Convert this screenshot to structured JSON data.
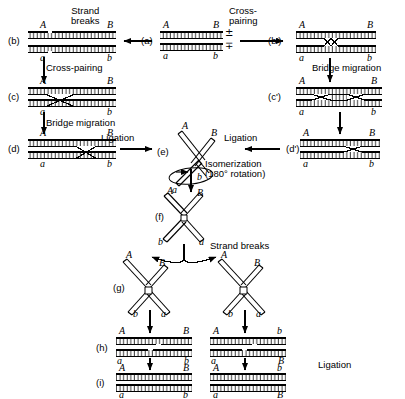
{
  "figure": {
    "type": "molecular-biology-pathway-diagram",
    "background": "#ffffff",
    "ink": "#000000"
  },
  "stages": [
    {
      "id": "a",
      "label": "(a)",
      "x": 141,
      "y": 41,
      "desc": "two aligned parental duplexes"
    },
    {
      "id": "b",
      "label": "(b)",
      "x": 8,
      "y": 41,
      "desc": "duplexes with single-strand breaks (nicks)"
    },
    {
      "id": "c",
      "label": "(c)",
      "x": 8,
      "y": 96,
      "desc": "cross-paired single crossover"
    },
    {
      "id": "d",
      "label": "(d)",
      "x": 8,
      "y": 150,
      "desc": "bridge migrated heteroduplex"
    },
    {
      "id": "bp",
      "label": "(b')",
      "x": 268,
      "y": 41,
      "desc": "cross-paired right branch"
    },
    {
      "id": "cp",
      "label": "(c')",
      "x": 268,
      "y": 96,
      "desc": "bridge migration right branch"
    },
    {
      "id": "dp",
      "label": "(d')",
      "x": 286,
      "y": 148,
      "desc": "ligated right branch"
    },
    {
      "id": "e",
      "label": "(e)",
      "x": 157,
      "y": 148,
      "desc": "chi-form Holliday junction"
    },
    {
      "id": "f",
      "label": "(f)",
      "x": 155,
      "y": 218,
      "desc": "isomerized chi form"
    },
    {
      "id": "g",
      "label": "(g)",
      "x": 113,
      "y": 288,
      "desc": "strand-break products"
    },
    {
      "id": "h",
      "label": "(h)",
      "x": 96,
      "y": 344,
      "desc": "resolved duplexes before ligation"
    },
    {
      "id": "i",
      "label": "(i)",
      "x": 96,
      "y": 379,
      "desc": "final ligated recombinant duplexes"
    }
  ],
  "processes": [
    {
      "id": "strand-breaks-top",
      "text": "Strand\nbreaks",
      "x": 71,
      "y": 8,
      "align": "center"
    },
    {
      "id": "cross-pairing-top",
      "text": "Cross-\npairing",
      "x": 229,
      "y": 8,
      "align": "left"
    },
    {
      "id": "cross-pairing-left",
      "text": "Cross-pairing",
      "x": 46,
      "y": 65,
      "align": "left"
    },
    {
      "id": "bridge-migration-left",
      "text": "Bridge migration",
      "x": 46,
      "y": 120,
      "align": "left"
    },
    {
      "id": "bridge-migration-right",
      "text": "Bridge migration",
      "x": 312,
      "y": 65,
      "align": "left"
    },
    {
      "id": "ligation-left",
      "text": "Ligation",
      "x": 101,
      "y": 135,
      "align": "left"
    },
    {
      "id": "ligation-right",
      "text": "Ligation",
      "x": 224,
      "y": 135,
      "align": "left"
    },
    {
      "id": "isomerization",
      "text": "Isomerization\n(180° rotation)",
      "x": 205,
      "y": 160,
      "align": "left"
    },
    {
      "id": "strand-breaks-mid",
      "text": "Strand breaks",
      "x": 210,
      "y": 243,
      "align": "left"
    },
    {
      "id": "ligation-bottom",
      "text": "Ligation",
      "x": 318,
      "y": 362,
      "align": "left"
    }
  ],
  "strand_labels": {
    "note": "Italic serif letters marking the four genetic markers on the duplex ends",
    "markers": [
      "A",
      "B",
      "a",
      "b"
    ]
  },
  "panels": {
    "a": {
      "top_left": "A",
      "top_right": "B",
      "bottom_left": "a",
      "bottom_right": "b",
      "polarity_top": "±",
      "polarity_bottom": "∓"
    },
    "b": {
      "top_left": "A",
      "top_right": "B",
      "bottom_left": "a",
      "bottom_right": "b"
    },
    "c": {
      "top_left": "A",
      "top_right": "B",
      "bottom_left": "a",
      "bottom_right": "b"
    },
    "d": {
      "top_left": "A",
      "top_right": "B",
      "bottom_left": "a",
      "bottom_right": "b"
    },
    "b_prime": {
      "top_left": "A",
      "top_right": "B",
      "bottom_left": "a",
      "bottom_right": "b"
    },
    "c_prime": {
      "top_left": "A",
      "top_right": "B",
      "bottom_left": "a",
      "bottom_right": "b"
    },
    "d_prime": {
      "top_left": "A",
      "top_right": "B",
      "bottom_left": "a",
      "bottom_right": "b"
    },
    "e": {
      "arm_upper_left": "A",
      "arm_upper_right": "B",
      "arm_lower_left": "a",
      "arm_lower_right": "b"
    },
    "f": {
      "arm_upper_left": "A",
      "arm_upper_right": "B",
      "arm_lower_left": "b",
      "arm_lower_right": "a"
    },
    "g_left": {
      "arm_upper_left": "A",
      "arm_upper_right": "B",
      "arm_lower_left": "b",
      "arm_lower_right": "a"
    },
    "g_right": {
      "arm_upper_left": "A",
      "arm_upper_right": "B",
      "arm_lower_left": "b",
      "arm_lower_right": "a"
    },
    "h_left": {
      "top_left": "A",
      "top_right": "B",
      "bottom_left": "a",
      "bottom_right": "b"
    },
    "h_right": {
      "top_left": "A",
      "top_right": "b",
      "bottom_left": "a",
      "bottom_right": "B"
    },
    "i_left": {
      "top_left": "A",
      "top_right": "B",
      "bottom_left": "a",
      "bottom_right": "b",
      "small_top_left": "a",
      "small_top_right": "b"
    },
    "i_right": {
      "top_left": "A",
      "top_right": "b",
      "bottom_left": "a",
      "bottom_right": "B",
      "small_top_left": "a",
      "small_top_right": "B"
    }
  }
}
